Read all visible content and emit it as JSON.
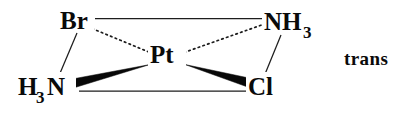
{
  "figure": {
    "isomer_label": "trans",
    "background_color": "#ffffff",
    "ink_color": "#0a0a0a"
  },
  "atoms": {
    "center": {
      "symbol": "Pt",
      "subscript": "",
      "x": 152,
      "y": 62
    },
    "top_left": {
      "symbol": "Br",
      "subscript": "",
      "x": 62,
      "y": 28
    },
    "top_right": {
      "symbol": "NH",
      "subscript": "3",
      "x": 265,
      "y": 30
    },
    "bottom_left": {
      "symbol": "H",
      "subscript": "3",
      "symbol2": "N",
      "x": 20,
      "y": 97
    },
    "bottom_right": {
      "symbol": "Cl",
      "subscript": "",
      "x": 249,
      "y": 96
    }
  },
  "bonds": [
    {
      "name": "br-to-nh3",
      "style": "plain",
      "from": "Br",
      "to": "NH3"
    },
    {
      "name": "br-to-pt",
      "style": "dotted",
      "from": "Br",
      "to": "Pt"
    },
    {
      "name": "br-to-h3n",
      "style": "plain",
      "from": "Br",
      "to": "H3N"
    },
    {
      "name": "pt-to-nh3",
      "style": "dotted",
      "from": "Pt",
      "to": "NH3"
    },
    {
      "name": "nh3-to-cl",
      "style": "plain",
      "from": "NH3",
      "to": "Cl"
    },
    {
      "name": "pt-to-h3n",
      "style": "wedge",
      "from": "Pt",
      "to": "H3N"
    },
    {
      "name": "pt-to-cl",
      "style": "wedge",
      "from": "Pt",
      "to": "Cl"
    },
    {
      "name": "h3n-to-cl",
      "style": "plain",
      "from": "H3N",
      "to": "Cl"
    }
  ]
}
